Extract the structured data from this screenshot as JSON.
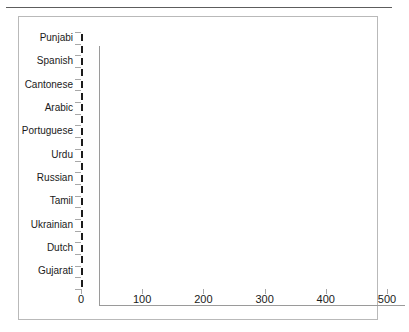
{
  "chart_data": {
    "type": "bar",
    "orientation": "horizontal",
    "title": "",
    "xlabel": "",
    "ylabel": "",
    "xlim": [
      0,
      500
    ],
    "xticks": [
      0,
      100,
      200,
      300,
      400,
      500
    ],
    "grid": false,
    "legend": false,
    "bar_color": "#3e3e3e",
    "bar_edge_color": "#1c1c1c",
    "axis_color": "#9a9a9a",
    "frame_color": "#b9b9b9",
    "note": "22 bars; category names are printed on every other bar (11 visible labels)",
    "categories": [
      "Punjabi",
      "",
      "Spanish",
      "",
      "Cantonese",
      "",
      "Arabic",
      "",
      "Portuguese",
      "",
      "Urdu",
      "",
      "Russian",
      "",
      "Tamil",
      "",
      "Ukrainian",
      "",
      "Dutch",
      "",
      "Gujarati",
      ""
    ],
    "visible_tick_labels": [
      "Punjabi",
      "Spanish",
      "Cantonese",
      "Arabic",
      "Portuguese",
      "Urdu",
      "Russian",
      "Tamil",
      "Ukrainian",
      "Dutch",
      "Gujarati"
    ],
    "values": [
      500,
      460,
      452,
      455,
      440,
      440,
      403,
      258,
      253,
      233,
      228,
      153,
      148,
      132,
      122,
      122,
      117,
      112,
      112,
      108,
      105,
      103
    ]
  }
}
